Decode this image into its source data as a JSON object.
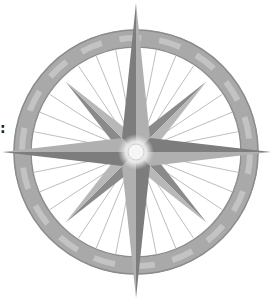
{
  "image": {
    "subject": "compass rose",
    "description": "Grayscale eight-pointed compass rose over a segmented ring with radiating spokes",
    "edge_glyph": ":"
  },
  "colors": {
    "background": "#ffffff",
    "ring_light": "#c8c8c8",
    "ring_mid": "#a8a8a8",
    "ring_dark": "#8a8a8a",
    "star_light": "#b4b4b4",
    "star_dark": "#7a7a7a",
    "spokes": "#b0b0b0",
    "center_glow": "#f4f4f4"
  }
}
